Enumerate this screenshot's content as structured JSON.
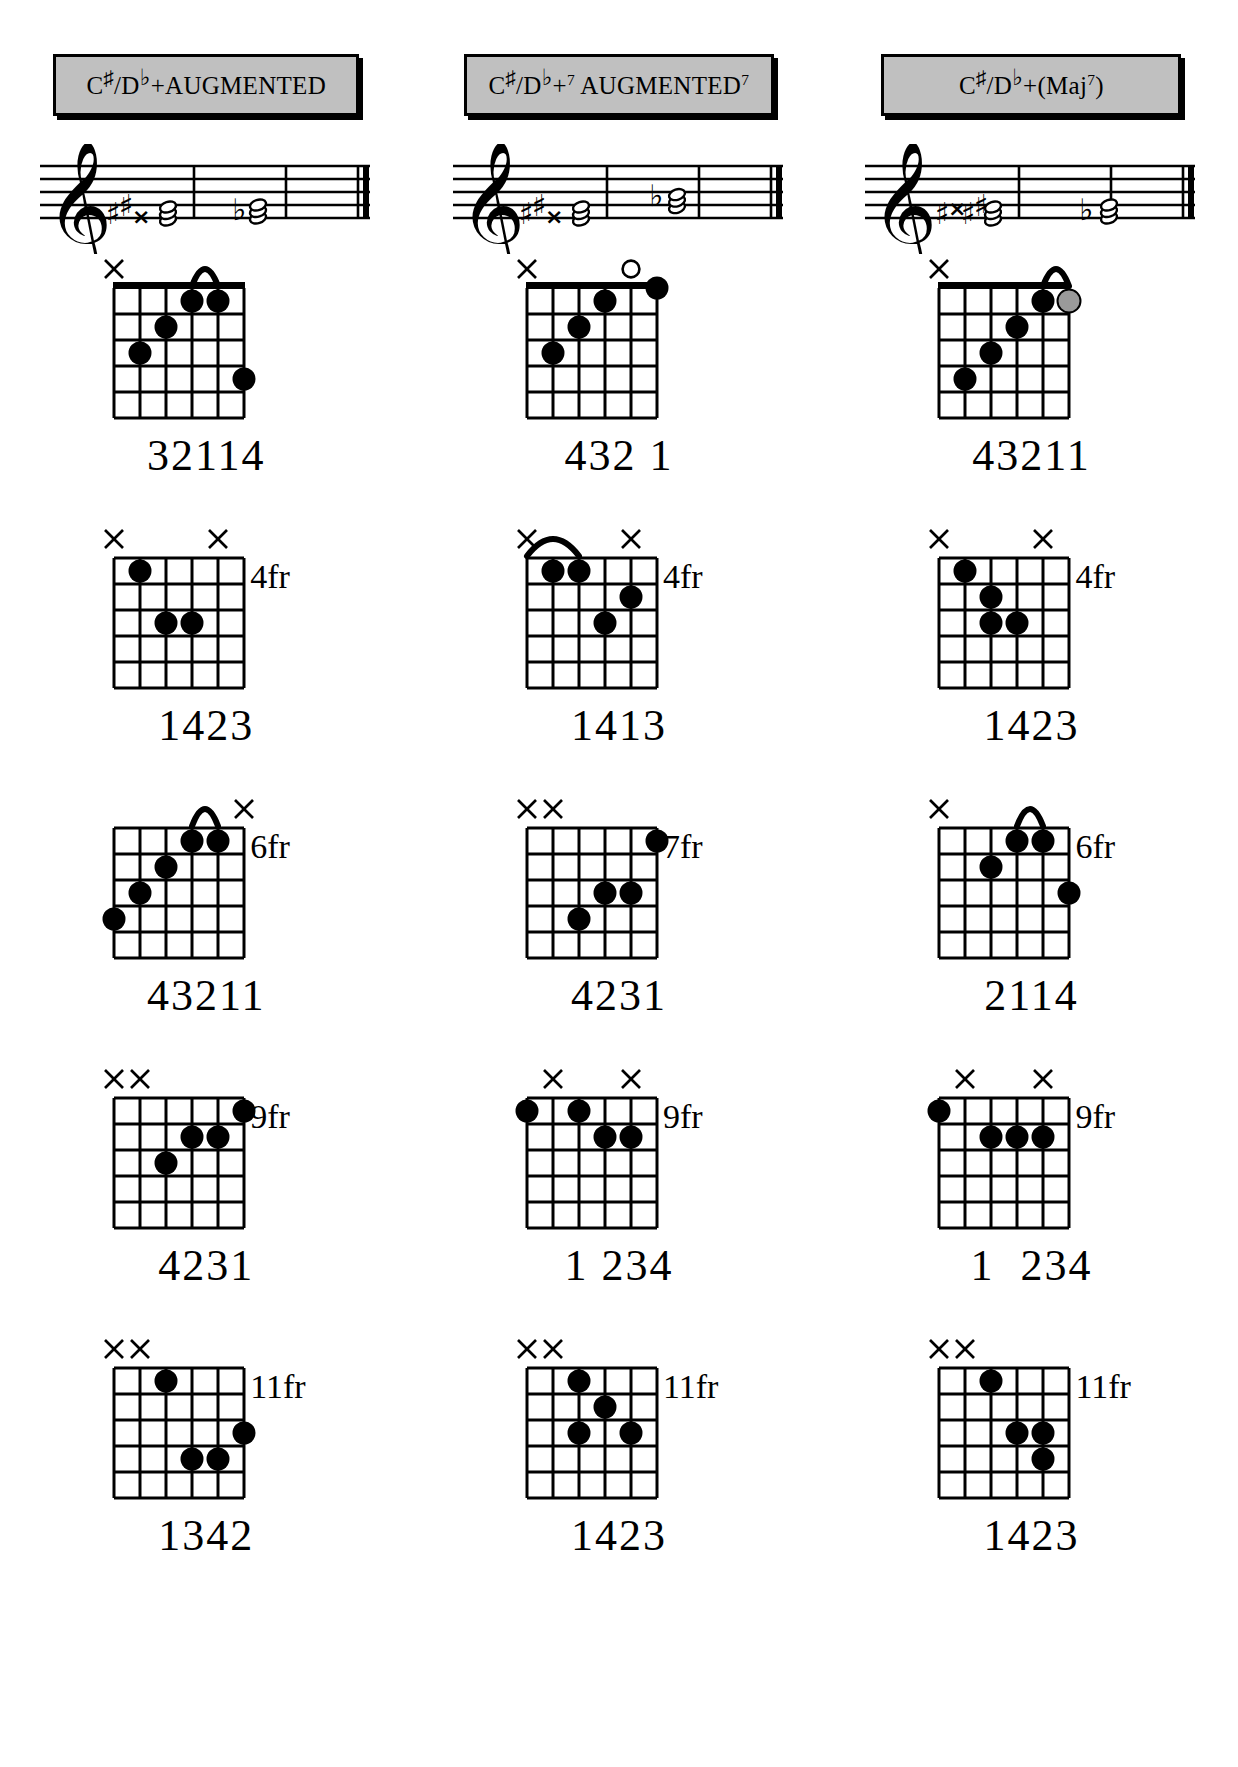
{
  "page": {
    "background_color": "#ffffff",
    "header_fill_color": "#c0c0c0",
    "dot_color": "#000000",
    "optional_dot_color": "#9a9a9a"
  },
  "columns": [
    {
      "id": "col-augmented",
      "header": {
        "root": "C",
        "root_accidental": "♯",
        "slash": "/",
        "alt_root": "D",
        "alt_accidental": "♭",
        "quality": "+",
        "quality_sup": "",
        "name": "AUGMENTED",
        "name_sup": "",
        "full_text": "C♯/D♭+AUGMENTED"
      },
      "staff": {
        "clef": "treble-clef",
        "accidentals": [
          "sharp",
          "sharp",
          "double-sharp"
        ],
        "second_accidental": "flat",
        "barlines": 2,
        "final_double_bar": true
      },
      "chords": [
        {
          "position_label": "",
          "fingering": "32114",
          "open_nut": true,
          "markers": [
            {
              "string": 6,
              "symbol": "x"
            },
            {
              "string": 1,
              "symbol": ""
            }
          ],
          "barre": {
            "from_string": 3,
            "to_string": 2,
            "fret": 1
          },
          "dots": [
            {
              "string": 3,
              "fret": 1,
              "type": "filled"
            },
            {
              "string": 2,
              "fret": 1,
              "type": "filled"
            },
            {
              "string": 4,
              "fret": 2,
              "type": "filled"
            },
            {
              "string": 5,
              "fret": 3,
              "type": "filled"
            },
            {
              "string": 1,
              "fret": 4,
              "type": "filled"
            }
          ]
        },
        {
          "position_label": "4fr",
          "fingering": "1423",
          "open_nut": false,
          "markers": [
            {
              "string": 6,
              "symbol": "x"
            },
            {
              "string": 2,
              "symbol": "x"
            }
          ],
          "barre": null,
          "dots": [
            {
              "string": 5,
              "fret": 1,
              "type": "filled"
            },
            {
              "string": 4,
              "fret": 3,
              "type": "filled"
            },
            {
              "string": 3,
              "fret": 3,
              "type": "filled"
            },
            {
              "string": 2,
              "fret": 2,
              "type": "none"
            }
          ]
        },
        {
          "position_label": "6fr",
          "fingering": "43211",
          "open_nut": false,
          "markers": [
            {
              "string": 6,
              "symbol": ""
            },
            {
              "string": 1,
              "symbol": "x"
            }
          ],
          "barre": {
            "from_string": 3,
            "to_string": 2,
            "fret": 1
          },
          "dots": [
            {
              "string": 3,
              "fret": 1,
              "type": "filled"
            },
            {
              "string": 2,
              "fret": 1,
              "type": "filled"
            },
            {
              "string": 4,
              "fret": 2,
              "type": "filled"
            },
            {
              "string": 5,
              "fret": 3,
              "type": "filled"
            },
            {
              "string": 6,
              "fret": 4,
              "type": "filled"
            }
          ]
        },
        {
          "position_label": "9fr",
          "fingering": "4231",
          "open_nut": false,
          "markers": [
            {
              "string": 6,
              "symbol": "x"
            },
            {
              "string": 5,
              "symbol": "x"
            }
          ],
          "barre": null,
          "dots": [
            {
              "string": 1,
              "fret": 1,
              "type": "filled"
            },
            {
              "string": 3,
              "fret": 2,
              "type": "filled"
            },
            {
              "string": 2,
              "fret": 2,
              "type": "filled"
            },
            {
              "string": 4,
              "fret": 3,
              "type": "filled"
            }
          ]
        },
        {
          "position_label": "11fr",
          "fingering": "1342",
          "open_nut": false,
          "markers": [
            {
              "string": 6,
              "symbol": "x"
            },
            {
              "string": 5,
              "symbol": "x"
            }
          ],
          "barre": null,
          "dots": [
            {
              "string": 4,
              "fret": 1,
              "type": "filled"
            },
            {
              "string": 1,
              "fret": 3,
              "type": "filled"
            },
            {
              "string": 3,
              "fret": 4,
              "type": "filled"
            },
            {
              "string": 2,
              "fret": 4,
              "type": "filled"
            }
          ]
        }
      ]
    },
    {
      "id": "col-augmented-7",
      "header": {
        "root": "C",
        "root_accidental": "♯",
        "slash": "/",
        "alt_root": "D",
        "alt_accidental": "♭",
        "quality": "+",
        "quality_sup": "7",
        "name": "AUGMENTED",
        "name_sup": "7",
        "full_text": "C♯/D♭+7 AUGMENTED7"
      },
      "staff": {
        "clef": "treble-clef",
        "accidentals": [
          "sharp",
          "sharp",
          "double-sharp"
        ],
        "second_accidental": "flat",
        "barlines": 2,
        "final_double_bar": true
      },
      "chords": [
        {
          "position_label": "",
          "fingering": "432 1",
          "open_nut": true,
          "markers": [
            {
              "string": 6,
              "symbol": "x"
            },
            {
              "string": 2,
              "symbol": "o"
            }
          ],
          "barre": null,
          "dots": [
            {
              "string": 1,
              "fret": 0,
              "type": "filled"
            },
            {
              "string": 3,
              "fret": 1,
              "type": "filled"
            },
            {
              "string": 4,
              "fret": 2,
              "type": "filled"
            },
            {
              "string": 5,
              "fret": 3,
              "type": "filled"
            }
          ]
        },
        {
          "position_label": "4fr",
          "fingering": "1413",
          "open_nut": false,
          "markers": [
            {
              "string": 6,
              "symbol": "x"
            },
            {
              "string": 2,
              "symbol": "x"
            }
          ],
          "barre": {
            "from_string": 6,
            "to_string": 4,
            "fret": 1
          },
          "dots": [
            {
              "string": 5,
              "fret": 1,
              "type": "filled"
            },
            {
              "string": 4,
              "fret": 1,
              "type": "filled"
            },
            {
              "string": 2,
              "fret": 2,
              "type": "filled"
            },
            {
              "string": 3,
              "fret": 3,
              "type": "filled"
            }
          ]
        },
        {
          "position_label": "7fr",
          "fingering": "4231",
          "open_nut": false,
          "markers": [
            {
              "string": 6,
              "symbol": "x"
            },
            {
              "string": 5,
              "symbol": "x"
            }
          ],
          "barre": null,
          "dots": [
            {
              "string": 1,
              "fret": 1,
              "type": "filled"
            },
            {
              "string": 3,
              "fret": 3,
              "type": "filled"
            },
            {
              "string": 2,
              "fret": 3,
              "type": "filled"
            },
            {
              "string": 4,
              "fret": 4,
              "type": "filled"
            }
          ]
        },
        {
          "position_label": "9fr",
          "fingering": "1 234",
          "open_nut": false,
          "markers": [
            {
              "string": 5,
              "symbol": "x"
            },
            {
              "string": 2,
              "symbol": "x"
            }
          ],
          "barre": null,
          "dots": [
            {
              "string": 6,
              "fret": 1,
              "type": "filled"
            },
            {
              "string": 4,
              "fret": 1,
              "type": "filled"
            },
            {
              "string": 3,
              "fret": 2,
              "type": "filled"
            },
            {
              "string": 2,
              "fret": 2,
              "type": "filled"
            }
          ]
        },
        {
          "position_label": "11fr",
          "fingering": "1423",
          "open_nut": false,
          "markers": [
            {
              "string": 6,
              "symbol": "x"
            },
            {
              "string": 5,
              "symbol": "x"
            }
          ],
          "barre": null,
          "dots": [
            {
              "string": 4,
              "fret": 1,
              "type": "filled"
            },
            {
              "string": 3,
              "fret": 2,
              "type": "filled"
            },
            {
              "string": 2,
              "fret": 3,
              "type": "filled"
            },
            {
              "string": 4,
              "fret": 3,
              "type": "filled"
            }
          ]
        }
      ]
    },
    {
      "id": "col-augmented-maj7",
      "header": {
        "root": "C",
        "root_accidental": "♯",
        "slash": "/",
        "alt_root": "D",
        "alt_accidental": "♭",
        "quality": "+",
        "quality_sup": "",
        "name": "(Maj",
        "name_sup": "7",
        "full_text": "C♯/D♭+(Maj7)"
      },
      "staff": {
        "clef": "treble-clef",
        "accidentals": [
          "sharp",
          "double-sharp",
          "sharp",
          "sharp"
        ],
        "second_accidental": "flat",
        "barlines": 2,
        "final_double_bar": true
      },
      "chords": [
        {
          "position_label": "",
          "fingering": "43211",
          "open_nut": true,
          "markers": [
            {
              "string": 6,
              "symbol": "x"
            },
            {
              "string": 1,
              "symbol": ""
            }
          ],
          "barre": {
            "from_string": 2,
            "to_string": 1,
            "fret": 1
          },
          "dots": [
            {
              "string": 2,
              "fret": 1,
              "type": "filled"
            },
            {
              "string": 1,
              "fret": 1,
              "type": "optional"
            },
            {
              "string": 3,
              "fret": 2,
              "type": "filled"
            },
            {
              "string": 4,
              "fret": 3,
              "type": "filled"
            },
            {
              "string": 5,
              "fret": 4,
              "type": "filled"
            }
          ]
        },
        {
          "position_label": "4fr",
          "fingering": "1423",
          "open_nut": false,
          "markers": [
            {
              "string": 6,
              "symbol": "x"
            },
            {
              "string": 2,
              "symbol": "x"
            }
          ],
          "barre": null,
          "dots": [
            {
              "string": 5,
              "fret": 1,
              "type": "filled"
            },
            {
              "string": 4,
              "fret": 2,
              "type": "filled"
            },
            {
              "string": 3,
              "fret": 3,
              "type": "filled"
            },
            {
              "string": 4,
              "fret": 3,
              "type": "filled"
            }
          ]
        },
        {
          "position_label": "6fr",
          "fingering": "2114",
          "open_nut": false,
          "markers": [
            {
              "string": 6,
              "symbol": "x"
            },
            {
              "string": 1,
              "symbol": ""
            }
          ],
          "barre": {
            "from_string": 3,
            "to_string": 2,
            "fret": 1
          },
          "dots": [
            {
              "string": 3,
              "fret": 1,
              "type": "filled"
            },
            {
              "string": 2,
              "fret": 1,
              "type": "filled"
            },
            {
              "string": 4,
              "fret": 2,
              "type": "filled"
            },
            {
              "string": 1,
              "fret": 3,
              "type": "filled"
            }
          ]
        },
        {
          "position_label": "9fr",
          "fingering": "1  234",
          "open_nut": false,
          "markers": [
            {
              "string": 5,
              "symbol": "x"
            },
            {
              "string": 2,
              "symbol": "x"
            }
          ],
          "barre": null,
          "dots": [
            {
              "string": 6,
              "fret": 1,
              "type": "filled"
            },
            {
              "string": 4,
              "fret": 2,
              "type": "filled"
            },
            {
              "string": 3,
              "fret": 2,
              "type": "filled"
            },
            {
              "string": 2,
              "fret": 2,
              "type": "filled"
            }
          ]
        },
        {
          "position_label": "11fr",
          "fingering": "1423",
          "open_nut": false,
          "markers": [
            {
              "string": 6,
              "symbol": "x"
            },
            {
              "string": 5,
              "symbol": "x"
            }
          ],
          "barre": null,
          "dots": [
            {
              "string": 4,
              "fret": 1,
              "type": "filled"
            },
            {
              "string": 3,
              "fret": 3,
              "type": "filled"
            },
            {
              "string": 2,
              "fret": 3,
              "type": "filled"
            },
            {
              "string": 2,
              "fret": 4,
              "type": "filled"
            }
          ]
        }
      ]
    }
  ],
  "diagram_geometry": {
    "strings": 6,
    "frets": 5,
    "string_spacing_px": 26,
    "fret_spacing_px": 26,
    "nut_thickness_px": 7,
    "dot_radius_px": 11
  }
}
